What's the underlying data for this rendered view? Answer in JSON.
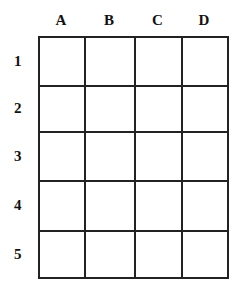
{
  "grid": {
    "columns": [
      "A",
      "B",
      "C",
      "D"
    ],
    "rows": [
      "1",
      "2",
      "3",
      "4",
      "5"
    ],
    "col_edges": [
      38,
      84,
      134,
      181,
      227
    ],
    "row_edges": [
      36,
      85,
      131,
      180,
      230,
      277
    ],
    "line_color": "#222222"
  }
}
